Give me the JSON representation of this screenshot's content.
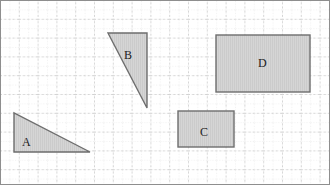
{
  "figure": {
    "width": 330,
    "height": 185,
    "background_color": "#ffffff",
    "frame_color": "#8e8e8e"
  },
  "grid": {
    "minor_spacing_px": 9.4,
    "major_spacing_px": 18.8,
    "minor_color": "#d8d8d8",
    "major_color": "#b5b5b5",
    "style": "dotted"
  },
  "style": {
    "shape_fill": "#d5d5d5",
    "shape_stroke": "#6e6e6e",
    "shape_stroke_width": 1.4,
    "hatch_color": "#c8c8c8",
    "label_color": "#1a1a1a"
  },
  "shapes": [
    {
      "id": "A",
      "label": "A",
      "type": "triangle",
      "points": "14,113 14,152 90,152",
      "label_x": 22,
      "label_y": 136,
      "base_px": 76,
      "height_px": 39
    },
    {
      "id": "B",
      "label": "B",
      "type": "triangle",
      "points": "108,33 147,33 147,108",
      "label_x": 124,
      "label_y": 49,
      "base_px": 39,
      "height_px": 75
    },
    {
      "id": "C",
      "label": "C",
      "type": "rectangle",
      "x": 178,
      "y": 111,
      "width": 56,
      "height": 36,
      "label_x": 200,
      "label_y": 126
    },
    {
      "id": "D",
      "label": "D",
      "type": "rectangle",
      "x": 216,
      "y": 35,
      "width": 94,
      "height": 57,
      "label_x": 258,
      "label_y": 57
    }
  ]
}
